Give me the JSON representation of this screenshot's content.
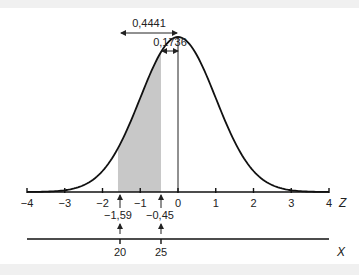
{
  "chart_data": {
    "type": "area",
    "title": "",
    "z_axis": {
      "label": "Z",
      "ticks": [
        -4,
        -3,
        -2,
        -1,
        0,
        1,
        2,
        3,
        4
      ],
      "tick_labels": [
        "−4",
        "−3",
        "−2",
        "−1",
        "0",
        "1",
        "2",
        "3",
        "4"
      ],
      "range": [
        -4,
        4
      ]
    },
    "x_axis": {
      "label": "X",
      "ticks": [
        20,
        25
      ],
      "tick_labels": [
        "20",
        "25"
      ]
    },
    "shaded_region": {
      "z_from": -1.59,
      "z_to": -0.45,
      "color": "#c8c8c8"
    },
    "markers": [
      {
        "z": -1.59,
        "label": "−1,59",
        "x_value": "20"
      },
      {
        "z": -0.45,
        "label": "−0,45",
        "x_value": "25"
      }
    ],
    "annotations": [
      {
        "label": "0,4441",
        "z_from": -1.59,
        "z_to": 0,
        "meaning": "area from -1.59 to 0"
      },
      {
        "label": "0,1736",
        "z_from": -0.45,
        "z_to": 0,
        "meaning": "area from -0.45 to 0"
      }
    ],
    "grid": false
  },
  "labels": {
    "ann_big": "0,4441",
    "ann_small": "0,1736",
    "z_var": "Z",
    "x_var": "X",
    "marker_left": "−1,59",
    "marker_right": "−0,45",
    "x_left": "20",
    "x_right": "25",
    "ticks": [
      "−4",
      "−3",
      "−2",
      "−1",
      "0",
      "1",
      "2",
      "3",
      "4"
    ]
  }
}
